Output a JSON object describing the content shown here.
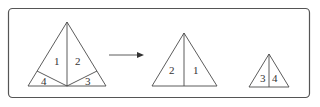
{
  "figure": {
    "colors": {
      "stroke": "#4a4a4a",
      "frame": "#555555",
      "background": "#ffffff"
    },
    "left_triangle": {
      "labels": [
        "1",
        "2",
        "3",
        "4"
      ]
    },
    "arrow": {
      "direction": "right"
    },
    "middle_triangle": {
      "labels": [
        "2",
        "1"
      ]
    },
    "right_triangle": {
      "labels": [
        "3",
        "4"
      ]
    }
  }
}
